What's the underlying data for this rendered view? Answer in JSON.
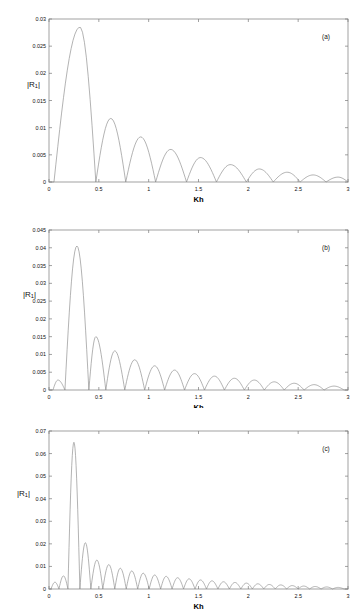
{
  "figure": {
    "background_color": "#ffffff",
    "curve_color": "#8a8a8a",
    "axis_color": "#7a7a7a"
  },
  "panels": [
    {
      "tag": "(a)",
      "ylabel_main": "|R",
      "ylabel_sub": "1",
      "ylabel_close": "|",
      "xlabel": "Kh",
      "y_ticks": [
        "0",
        "0.005",
        "0.01",
        "0.015",
        "0.02",
        "0.025",
        "0.03"
      ],
      "x_ticks": [
        "0",
        "0.5",
        "1",
        "1.5",
        "2",
        "2.5",
        "3"
      ]
    },
    {
      "tag": "(b)",
      "ylabel_main": "|R",
      "ylabel_sub": "1",
      "ylabel_close": "|",
      "xlabel": "Kh",
      "y_ticks": [
        "0",
        "0.005",
        "0.01",
        "0.015",
        "0.02",
        "0.025",
        "0.03",
        "0.035",
        "0.04",
        "0.045"
      ],
      "x_ticks": [
        "0",
        "0.5",
        "1",
        "1.5",
        "2",
        "2.5",
        "3"
      ]
    },
    {
      "tag": "(c)",
      "ylabel_main": "|R",
      "ylabel_sub": "1",
      "ylabel_close": "|",
      "xlabel": "Kh",
      "y_ticks": [
        "0",
        "0.01",
        "0.02",
        "0.03",
        "0.04",
        "0.05",
        "0.06",
        "0.07"
      ],
      "x_ticks": [
        "0",
        "0.5",
        "1",
        "1.5",
        "2",
        "2.5",
        "3"
      ]
    }
  ],
  "chart_data": [
    {
      "type": "line",
      "title": "(a)",
      "xlabel": "Kh",
      "ylabel": "|R1|",
      "xlim": [
        0,
        3
      ],
      "ylim": [
        0,
        0.03
      ],
      "xticks": [
        0,
        0.5,
        1,
        1.5,
        2,
        2.5,
        3
      ],
      "yticks": [
        0,
        0.005,
        0.01,
        0.015,
        0.02,
        0.025,
        0.03
      ],
      "grid": false,
      "legend": "none",
      "description": "Decaying oscillatory lobes; main lobe peaks near Kh=0.31 at |R1|=0.0285, zeros near 0.47, 0.77, 1.07, 1.38, 1.68, 1.98, 2.25, 2.52, 2.78",
      "peaks": [
        {
          "x": 0.31,
          "y": 0.0285
        },
        {
          "x": 0.62,
          "y": 0.0117
        },
        {
          "x": 0.92,
          "y": 0.0083
        },
        {
          "x": 1.22,
          "y": 0.006
        },
        {
          "x": 1.52,
          "y": 0.0045
        },
        {
          "x": 1.82,
          "y": 0.0032
        },
        {
          "x": 2.11,
          "y": 0.0024
        },
        {
          "x": 2.39,
          "y": 0.0018
        },
        {
          "x": 2.65,
          "y": 0.0013
        },
        {
          "x": 2.9,
          "y": 0.0009
        }
      ],
      "zeros": [
        0.05,
        0.47,
        0.77,
        1.07,
        1.38,
        1.68,
        1.98,
        2.25,
        2.52,
        2.78,
        3.0
      ]
    },
    {
      "type": "line",
      "title": "(b)",
      "xlabel": "Kh",
      "ylabel": "|R1|",
      "xlim": [
        0,
        3
      ],
      "ylim": [
        0,
        0.045
      ],
      "xticks": [
        0,
        0.5,
        1,
        1.5,
        2,
        2.5,
        3
      ],
      "yticks": [
        0,
        0.005,
        0.01,
        0.015,
        0.02,
        0.025,
        0.03,
        0.035,
        0.04,
        0.045
      ],
      "grid": false,
      "legend": "none",
      "description": "Small precursor bump near Kh=0.09, then tall main lobe peaking at Kh=0.28 with |R1|=0.0405, followed by decaying lobes of period about 0.20",
      "peaks": [
        {
          "x": 0.09,
          "y": 0.0028
        },
        {
          "x": 0.28,
          "y": 0.0405
        },
        {
          "x": 0.47,
          "y": 0.015
        },
        {
          "x": 0.66,
          "y": 0.011
        },
        {
          "x": 0.86,
          "y": 0.0085
        },
        {
          "x": 1.06,
          "y": 0.0068
        },
        {
          "x": 1.26,
          "y": 0.0056
        },
        {
          "x": 1.46,
          "y": 0.0046
        },
        {
          "x": 1.66,
          "y": 0.0039
        },
        {
          "x": 1.86,
          "y": 0.0033
        },
        {
          "x": 2.06,
          "y": 0.0028
        },
        {
          "x": 2.26,
          "y": 0.0023
        },
        {
          "x": 2.46,
          "y": 0.0019
        },
        {
          "x": 2.66,
          "y": 0.0015
        },
        {
          "x": 2.86,
          "y": 0.0011
        }
      ],
      "zeros": [
        0.04,
        0.16,
        0.4,
        0.57,
        0.76,
        0.96,
        1.16,
        1.36,
        1.56,
        1.76,
        1.96,
        2.16,
        2.36,
        2.56,
        2.76,
        2.96
      ]
    },
    {
      "type": "line",
      "title": "(c)",
      "xlabel": "Kh",
      "ylabel": "|R1|",
      "xlim": [
        0,
        3
      ],
      "ylim": [
        0,
        0.07
      ],
      "xticks": [
        0,
        0.5,
        1,
        1.5,
        2,
        2.5,
        3
      ],
      "yticks": [
        0,
        0.01,
        0.02,
        0.03,
        0.04,
        0.05,
        0.06,
        0.07
      ],
      "grid": false,
      "legend": "none",
      "description": "Two small precursor bumps near Kh=0.06 and 0.14, then very narrow tall main lobe peaking at Kh=0.25 with |R1|=0.065, followed by rapidly decaying dense lobes of period about 0.115",
      "peaks": [
        {
          "x": 0.06,
          "y": 0.003
        },
        {
          "x": 0.145,
          "y": 0.0058
        },
        {
          "x": 0.25,
          "y": 0.065
        },
        {
          "x": 0.365,
          "y": 0.0205
        },
        {
          "x": 0.48,
          "y": 0.0128
        },
        {
          "x": 0.6,
          "y": 0.0108
        },
        {
          "x": 0.715,
          "y": 0.0092
        },
        {
          "x": 0.83,
          "y": 0.008
        },
        {
          "x": 0.945,
          "y": 0.007
        },
        {
          "x": 1.06,
          "y": 0.0062
        },
        {
          "x": 1.175,
          "y": 0.0056
        },
        {
          "x": 1.29,
          "y": 0.005
        },
        {
          "x": 1.405,
          "y": 0.0045
        },
        {
          "x": 1.52,
          "y": 0.004
        },
        {
          "x": 1.635,
          "y": 0.0036
        },
        {
          "x": 1.75,
          "y": 0.0032
        },
        {
          "x": 1.865,
          "y": 0.0029
        },
        {
          "x": 1.98,
          "y": 0.0026
        },
        {
          "x": 2.095,
          "y": 0.0023
        },
        {
          "x": 2.21,
          "y": 0.002
        },
        {
          "x": 2.325,
          "y": 0.0018
        },
        {
          "x": 2.44,
          "y": 0.0015
        },
        {
          "x": 2.555,
          "y": 0.0013
        },
        {
          "x": 2.67,
          "y": 0.0011
        },
        {
          "x": 2.785,
          "y": 0.0009
        },
        {
          "x": 2.9,
          "y": 0.0007
        }
      ],
      "zeros": [
        0.02,
        0.1,
        0.19,
        0.31,
        0.42,
        0.54,
        0.66,
        0.775,
        0.89,
        1.005,
        1.12,
        1.235,
        1.35,
        1.465,
        1.58,
        1.695,
        1.81,
        1.925,
        2.04,
        2.155,
        2.27,
        2.385,
        2.5,
        2.615,
        2.73,
        2.845,
        2.96
      ]
    }
  ]
}
